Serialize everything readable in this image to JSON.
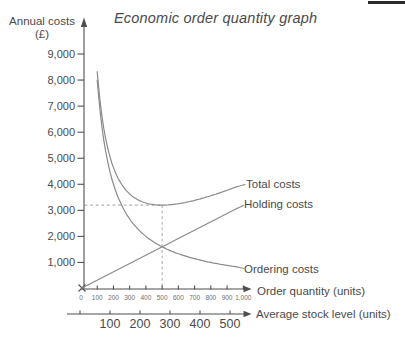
{
  "window": {
    "width": 405,
    "height": 344
  },
  "title": {
    "text": "Economic order quantity graph"
  },
  "y_axis": {
    "label": "Annual costs",
    "unit": "(£)",
    "tick_labels": [
      "9,000",
      "8,000",
      "7,000",
      "6,000",
      "5,000",
      "4,000",
      "3,000",
      "2,000",
      "1,000"
    ]
  },
  "x_axis": {
    "label": "Order quantity (units)",
    "tick_labels": [
      "0",
      "100",
      "200",
      "300",
      "400",
      "500",
      "600",
      "700",
      "800",
      "900",
      "1,000"
    ]
  },
  "x_axis2": {
    "label": "Average stock level (units)",
    "tick_labels": [
      "100",
      "200",
      "300",
      "400",
      "500"
    ]
  },
  "curve_labels": {
    "total": "Total costs",
    "holding": "Holding costs",
    "ordering": "Ordering costs"
  },
  "chart_data": {
    "type": "line",
    "title": "Economic order quantity graph",
    "xlabel": "Order quantity (units)",
    "x2label": "Average stock level (units)",
    "ylabel": "Annual costs (£)",
    "xlim": [
      0,
      1000
    ],
    "ylim": [
      0,
      9000
    ],
    "grid": false,
    "legend_position": "labels-right-of-curves",
    "x_ticks": [
      0,
      100,
      200,
      300,
      400,
      500,
      600,
      700,
      800,
      900,
      1000
    ],
    "y_ticks": [
      9000,
      8000,
      7000,
      6000,
      5000,
      4000,
      3000,
      2000,
      1000
    ],
    "x2_ticks": [
      100,
      200,
      300,
      400,
      500
    ],
    "x2_relation": "average stock level = order quantity / 2",
    "series": [
      {
        "name": "Holding costs",
        "shape": "linear",
        "x": [
          0,
          100,
          200,
          300,
          400,
          500,
          600,
          700,
          800,
          900,
          1000
        ],
        "values": [
          0,
          320,
          640,
          960,
          1280,
          1600,
          1920,
          2240,
          2560,
          2880,
          3200
        ]
      },
      {
        "name": "Ordering costs",
        "shape": "inverse",
        "x": [
          100,
          200,
          300,
          400,
          500,
          600,
          700,
          800,
          900,
          1000
        ],
        "values": [
          8000,
          4000,
          2667,
          2000,
          1600,
          1333,
          1143,
          1000,
          889,
          800
        ]
      },
      {
        "name": "Total costs",
        "shape": "sum",
        "x": [
          100,
          200,
          300,
          400,
          500,
          600,
          700,
          800,
          900,
          1000
        ],
        "values": [
          8320,
          4640,
          3627,
          3280,
          3200,
          3253,
          3383,
          3560,
          3769,
          4000
        ]
      }
    ],
    "annotations": {
      "eoq_order_quantity": 500,
      "minimum_total_cost": 3200,
      "curve_crossover_cost": 1600,
      "dashed_guides": {
        "x": 500,
        "y": 3200
      }
    }
  },
  "colors": {
    "background": "#ffffff",
    "curve": "#8a8a8a",
    "axis": "#4f4f4f",
    "text": "#4a4a4a",
    "tick_text_small": "#707070",
    "dashed": "#b0b0b0",
    "rule": "#2b2b2b"
  }
}
